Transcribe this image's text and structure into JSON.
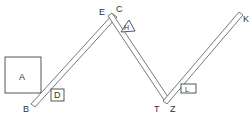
{
  "diagram": {
    "labels": {
      "A": "A",
      "B": "B",
      "C": "C",
      "D": "D",
      "E": "E",
      "H": "H",
      "K": "K",
      "L": "L",
      "T": "T",
      "Z": "Z"
    },
    "colors": {
      "stroke": "#555555",
      "background": "#ffffff",
      "text": "#333333"
    }
  }
}
